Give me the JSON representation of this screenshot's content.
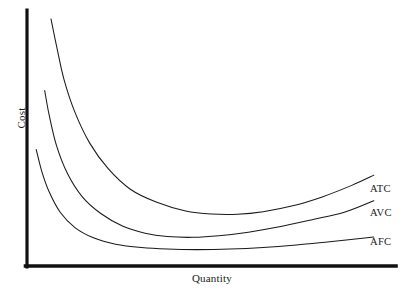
{
  "chart_data": {
    "type": "line",
    "title": "",
    "xlabel": "Quantity",
    "ylabel": "Cost",
    "grid": false,
    "legend_position": "right-inline-labels",
    "axis_style": "L-shaped thick black axes, no tick marks, no numeric scale",
    "xlim": [
      0,
      100
    ],
    "ylim": [
      0,
      100
    ],
    "annotations": [
      "AVC and AFC curves cross near the left-middle of the plot",
      "ATC lies above AVC everywhere; the vertical gap between ATC and AVC narrows as quantity rises",
      "AFC declines continuously and flattens toward the horizontal axis"
    ],
    "series": [
      {
        "name": "ATC",
        "label": "ATC",
        "description": "Average Total Cost - U-shaped curve, highest of the three",
        "color": "#1a1a1a",
        "points": [
          {
            "x": 6.5,
            "y": 96.5
          },
          {
            "x": 8.0,
            "y": 86.0
          },
          {
            "x": 10.0,
            "y": 73.0
          },
          {
            "x": 13.0,
            "y": 60.0
          },
          {
            "x": 17.0,
            "y": 48.0
          },
          {
            "x": 22.0,
            "y": 38.0
          },
          {
            "x": 28.0,
            "y": 30.0
          },
          {
            "x": 35.0,
            "y": 25.0
          },
          {
            "x": 43.0,
            "y": 21.5
          },
          {
            "x": 50.0,
            "y": 20.3
          },
          {
            "x": 57.0,
            "y": 20.2
          },
          {
            "x": 64.0,
            "y": 21.2
          },
          {
            "x": 72.0,
            "y": 23.5
          },
          {
            "x": 80.0,
            "y": 27.0
          },
          {
            "x": 88.0,
            "y": 31.5
          },
          {
            "x": 94.0,
            "y": 35.5
          }
        ]
      },
      {
        "name": "AVC",
        "label": "AVC",
        "description": "Average Variable Cost - U-shaped curve, below ATC",
        "color": "#1a1a1a",
        "points": [
          {
            "x": 4.8,
            "y": 68.5
          },
          {
            "x": 6.0,
            "y": 59.0
          },
          {
            "x": 8.0,
            "y": 47.0
          },
          {
            "x": 11.0,
            "y": 36.0
          },
          {
            "x": 15.0,
            "y": 27.0
          },
          {
            "x": 20.0,
            "y": 20.5
          },
          {
            "x": 26.0,
            "y": 15.5
          },
          {
            "x": 32.0,
            "y": 12.8
          },
          {
            "x": 38.0,
            "y": 11.5
          },
          {
            "x": 45.0,
            "y": 11.2
          },
          {
            "x": 52.0,
            "y": 11.8
          },
          {
            "x": 60.0,
            "y": 13.2
          },
          {
            "x": 68.0,
            "y": 15.2
          },
          {
            "x": 77.0,
            "y": 18.0
          },
          {
            "x": 86.0,
            "y": 21.0
          },
          {
            "x": 94.0,
            "y": 25.5
          }
        ]
      },
      {
        "name": "AFC",
        "label": "AFC",
        "description": "Average Fixed Cost - steadily declining, flattening curve",
        "color": "#1a1a1a",
        "points": [
          {
            "x": 2.5,
            "y": 45.5
          },
          {
            "x": 4.0,
            "y": 37.0
          },
          {
            "x": 6.0,
            "y": 29.0
          },
          {
            "x": 9.0,
            "y": 21.0
          },
          {
            "x": 13.0,
            "y": 15.0
          },
          {
            "x": 18.0,
            "y": 11.0
          },
          {
            "x": 24.0,
            "y": 8.5
          },
          {
            "x": 31.0,
            "y": 7.2
          },
          {
            "x": 38.0,
            "y": 6.6
          },
          {
            "x": 46.0,
            "y": 6.4
          },
          {
            "x": 55.0,
            "y": 6.6
          },
          {
            "x": 64.0,
            "y": 7.2
          },
          {
            "x": 73.0,
            "y": 8.2
          },
          {
            "x": 82.0,
            "y": 9.5
          },
          {
            "x": 94.0,
            "y": 11.3
          }
        ]
      }
    ]
  },
  "labels": {
    "y_axis": "Cost",
    "x_axis": "Quantity",
    "atc": "ATC",
    "avc": "AVC",
    "afc": "AFC"
  },
  "colors": {
    "axis": "#111111",
    "curve": "#1a1a1a",
    "background": "#ffffff"
  }
}
